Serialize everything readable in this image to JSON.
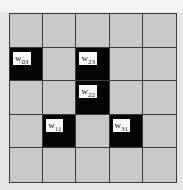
{
  "grid": {
    "rows": 5,
    "cols": 5,
    "colors": {
      "cell": "#c9c9c9",
      "active": "#050505",
      "line": "#3a3a3a",
      "label_bg": "#f8f8f8"
    },
    "active_cells": [
      {
        "row": 1,
        "col": 0,
        "symbol": "w",
        "sub": "03"
      },
      {
        "row": 1,
        "col": 2,
        "symbol": "w",
        "sub": "23"
      },
      {
        "row": 2,
        "col": 2,
        "symbol": "w",
        "sub": "22"
      },
      {
        "row": 3,
        "col": 1,
        "symbol": "w",
        "sub": "11"
      },
      {
        "row": 3,
        "col": 3,
        "symbol": "w",
        "sub": "31"
      }
    ]
  }
}
